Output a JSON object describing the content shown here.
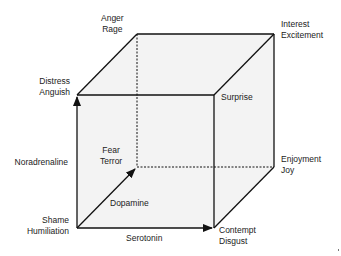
{
  "diagram": {
    "colors": {
      "face_fill": "#f3f3f3",
      "edge": "#111111",
      "text": "#222222"
    },
    "vertices": {
      "shame_humiliation": {
        "line1": "Shame",
        "line2": "Humiliation"
      },
      "distress_anguish": {
        "line1": "Distress",
        "line2": "Anguish"
      },
      "fear_terror": {
        "line1": "Fear",
        "line2": "Terror"
      },
      "anger_rage": {
        "line1": "Anger",
        "line2": "Rage"
      },
      "contempt_disgust": {
        "line1": "Contempt",
        "line2": "Disgust"
      },
      "surprise": {
        "line1": "Surprise"
      },
      "enjoyment_joy": {
        "line1": "Enjoyment",
        "line2": "Joy"
      },
      "interest_excitement": {
        "line1": "Interest",
        "line2": "Excitement"
      }
    },
    "axes": {
      "noradrenaline": "Noradrenaline",
      "dopamine": "Dopamine",
      "serotonin": "Serotonin"
    }
  }
}
